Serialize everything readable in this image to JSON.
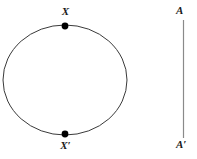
{
  "figure": {
    "background_color": "#ffffff",
    "stroke_color": "#3a3a3a",
    "point_color": "#000000",
    "label_color": "#1a1a1a",
    "circle": {
      "name": "circle",
      "center_x": 65,
      "center_y": 80,
      "radius_x": 62,
      "radius_y": 55,
      "stroke_width": 1
    },
    "points": [
      {
        "id": "point-x",
        "label": "X",
        "x": 65,
        "y": 26,
        "radius": 3.4,
        "label_position": "above"
      },
      {
        "id": "point-x-prime",
        "label": "X′",
        "x": 65,
        "y": 134,
        "radius": 3.4,
        "label_position": "below"
      }
    ],
    "axis_line": {
      "name": "vertical-axis-line",
      "x": 183.5,
      "y_top": 20,
      "y_bottom": 138,
      "stroke_width": 1,
      "top_label": "A",
      "bottom_label": "A′"
    }
  }
}
